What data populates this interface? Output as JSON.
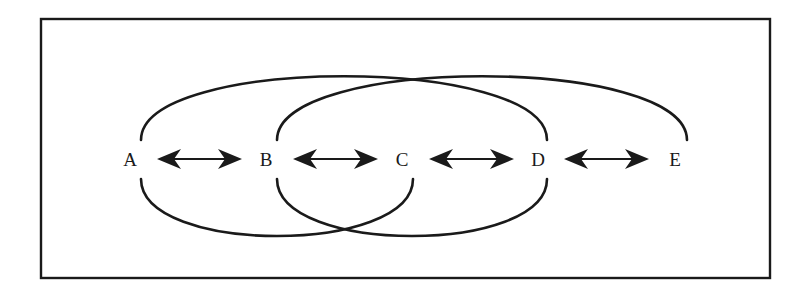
{
  "diagram": {
    "type": "arc-linkage",
    "nodes": [
      {
        "id": "A",
        "label": "A",
        "x": 130
      },
      {
        "id": "B",
        "label": "B",
        "x": 266
      },
      {
        "id": "C",
        "label": "C",
        "x": 402
      },
      {
        "id": "D",
        "label": "D",
        "x": 538
      },
      {
        "id": "E",
        "label": "E",
        "x": 675
      }
    ],
    "bidirectional_arrows": [
      {
        "from": "A",
        "to": "B"
      },
      {
        "from": "B",
        "to": "C"
      },
      {
        "from": "C",
        "to": "D"
      },
      {
        "from": "D",
        "to": "E"
      }
    ],
    "top_arcs": [
      {
        "from": "A",
        "to": "D"
      },
      {
        "from": "B",
        "to": "E"
      }
    ],
    "bottom_arcs": [
      {
        "from": "A",
        "to": "C"
      },
      {
        "from": "B",
        "to": "D"
      }
    ],
    "colors": {
      "stroke": "#1a1a1a",
      "background": "#ffffff"
    }
  }
}
